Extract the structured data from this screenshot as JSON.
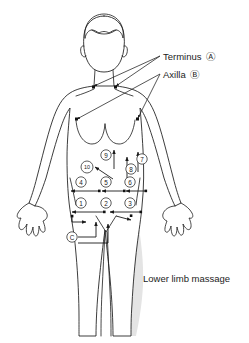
{
  "figure": {
    "caption": "Lower limb massage"
  },
  "colors": {
    "outline": "#1a1a1a",
    "shading": "#e4e4e4",
    "text": "#1c1c1c",
    "leader": "#2b2b2b",
    "background": "#ffffff"
  },
  "callouts": [
    {
      "id": "terminus",
      "label": "Terminus",
      "badge": "Ⓐ",
      "x": 163,
      "y": 57
    },
    {
      "id": "axilla",
      "label": "Axilla",
      "badge": "Ⓑ",
      "x": 163,
      "y": 75
    }
  ],
  "caption": {
    "text": "Lower limb massage",
    "x": 143,
    "y": 279
  },
  "markers": [
    {
      "id": "m1",
      "label": "①",
      "number": 1,
      "x": 81,
      "y": 203,
      "size": "normal"
    },
    {
      "id": "m2",
      "label": "②",
      "number": 2,
      "x": 106,
      "y": 203,
      "size": "normal"
    },
    {
      "id": "m3",
      "label": "③",
      "number": 3,
      "x": 130,
      "y": 203,
      "size": "normal"
    },
    {
      "id": "m4",
      "label": "④",
      "number": 4,
      "x": 81,
      "y": 182,
      "size": "normal"
    },
    {
      "id": "m5",
      "label": "⑤",
      "number": 5,
      "x": 106,
      "y": 182,
      "size": "normal"
    },
    {
      "id": "m6",
      "label": "⑥",
      "number": 6,
      "x": 130,
      "y": 182,
      "size": "normal"
    },
    {
      "id": "m7",
      "label": "⑦",
      "number": 7,
      "x": 142,
      "y": 159,
      "size": "normal"
    },
    {
      "id": "m8",
      "label": "⑧",
      "number": 8,
      "x": 131,
      "y": 169,
      "size": "normal"
    },
    {
      "id": "m9",
      "label": "⑨",
      "number": 9,
      "x": 106,
      "y": 155,
      "size": "normal"
    },
    {
      "id": "m10",
      "label": "⑩",
      "number": 10,
      "x": 87,
      "y": 167,
      "size": "small"
    },
    {
      "id": "mC",
      "label": "Ⓒ",
      "number": null,
      "x": 72,
      "y": 237,
      "size": "normal"
    }
  ],
  "terminus_points": [
    {
      "x": 93,
      "y": 87
    },
    {
      "x": 115,
      "y": 87
    }
  ],
  "axilla_points": [
    {
      "x": 76,
      "y": 119
    },
    {
      "x": 137,
      "y": 119
    }
  ],
  "flow_arrows": [
    {
      "id": "row1-left",
      "direction": "left",
      "from_x": 104,
      "to_x": 70,
      "y": 212
    },
    {
      "id": "row1-right",
      "direction": "left",
      "from_x": 141,
      "to_x": 110,
      "y": 212
    },
    {
      "id": "row2-left",
      "direction": "left",
      "from_x": 100,
      "to_x": 70,
      "y": 191
    },
    {
      "id": "row2-mid",
      "direction": "left",
      "from_x": 124,
      "to_x": 101,
      "y": 191
    },
    {
      "id": "row2-right",
      "direction": "left",
      "from_x": 145,
      "to_x": 125,
      "y": 191
    },
    {
      "id": "col-up-9",
      "direction": "up",
      "x": 114,
      "from_y": 170,
      "to_y": 151
    },
    {
      "id": "col-up-8",
      "direction": "up",
      "x": 127,
      "from_y": 180,
      "to_y": 157
    },
    {
      "id": "col-up-7",
      "direction": "up",
      "x": 138,
      "from_y": 172,
      "to_y": 152
    },
    {
      "id": "diag-10",
      "direction": "upleft",
      "from_x": 112,
      "from_y": 178,
      "to_x": 95,
      "to_y": 166
    }
  ]
}
